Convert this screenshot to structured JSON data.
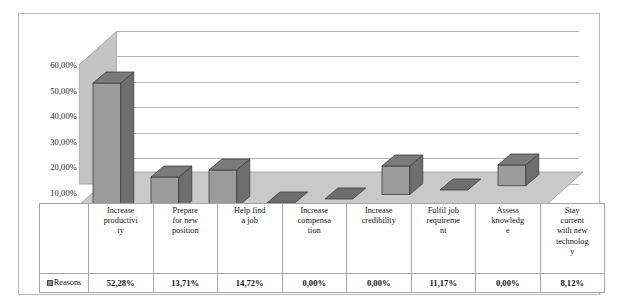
{
  "chart_data": {
    "type": "bar",
    "title": "",
    "subtitle": "",
    "xlabel": "",
    "ylabel": "",
    "categories": [
      "Increase productivity",
      "Prepare for new position",
      "Help find a job",
      "Increase compensation",
      "Increase credibility",
      "Fulfil job requirement",
      "Assess knowledge",
      "Stay current with new technology"
    ],
    "category_lines": [
      [
        "Increase",
        "productivi",
        "ty"
      ],
      [
        "Prepare",
        "for new",
        "position"
      ],
      [
        "Help find",
        "a job"
      ],
      [
        "Increase",
        "compensa",
        "tion"
      ],
      [
        "Increase",
        "credibility"
      ],
      [
        "Fulfil job",
        "requireme",
        "nt"
      ],
      [
        "Assess",
        "knowledg",
        "e"
      ],
      [
        "Stay",
        "current",
        "with new",
        "technolog",
        "y"
      ]
    ],
    "series": [
      {
        "name": "Reasons",
        "values": [
          52.28,
          13.71,
          14.72,
          0.0,
          0.0,
          11.17,
          0.0,
          8.12
        ],
        "value_labels": [
          "52,28%",
          "13,71%",
          "14,72%",
          "0,00%",
          "0,00%",
          "11,17%",
          "0,00%",
          "8,12%"
        ]
      }
    ],
    "ylim": [
      0,
      60
    ],
    "ytick_values": [
      60,
      50,
      40,
      30,
      20,
      10,
      0
    ],
    "ytick_labels": [
      "60,00%",
      "50,00%",
      "40,00%",
      "30,00%",
      "20,00%",
      "10,00%",
      "0,00%"
    ],
    "grid": true,
    "legend_position": "data-table",
    "style": "3d-column",
    "colors": {
      "bar_front": "#9b9b9b",
      "bar_side": "#6e6e6e",
      "bar_top": "#7a7a7a",
      "bar_outline": "#3d3d3d",
      "floor": "#c9c9c9",
      "side_wall": "#c4c4c4",
      "back_wall": "#ffffff",
      "gridline": "#b5b5b5",
      "frame_border": "#b9b9b9",
      "table_border": "#a6a6a6",
      "text": "#141414"
    }
  },
  "legend": {
    "swatch_label": "Reasons"
  }
}
